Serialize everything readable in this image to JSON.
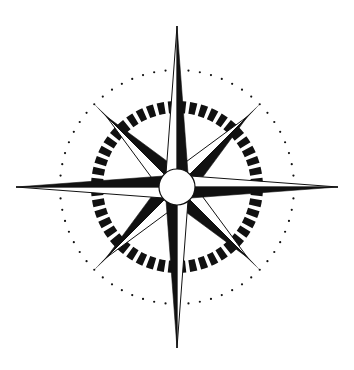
{
  "image": {
    "title": "Compass Rose",
    "subject": "compass-rose",
    "width": 354,
    "height": 370,
    "background_color": "#ffffff",
    "ink_color": "#111111",
    "style": "black and white line art, scanned drawing"
  },
  "geometry": {
    "center_x": 177,
    "center_y": 187,
    "hub_radius": 18,
    "hub_fill": "#ffffff",
    "hub_stroke": "#111111",
    "hub_stroke_width": 1.2,
    "ring_outer_radius": 86,
    "ring_inner_radius": 74,
    "ring_segment_count": 48,
    "ring_segment_gap_degrees": 2.6,
    "dotted_circle_radius": 117,
    "dot_count": 64,
    "dot_radius": 1.1
  },
  "points": {
    "cardinal": {
      "label": "cardinal-points",
      "count": 4,
      "directions": [
        "north",
        "east",
        "south",
        "west"
      ],
      "angles_degrees": [
        0,
        90,
        180,
        270
      ],
      "tip_distance": 161,
      "half_width": 12,
      "light_fill": "#ffffff",
      "dark_fill": "#111111",
      "stroke": "#111111"
    },
    "ordinal": {
      "label": "ordinal-points",
      "count": 4,
      "directions": [
        "northeast",
        "southeast",
        "southwest",
        "northwest"
      ],
      "angles_degrees": [
        45,
        135,
        225,
        315
      ],
      "tip_distance": 100,
      "half_width": 15,
      "light_fill": "#ffffff",
      "dark_fill": "#111111",
      "stroke": "#111111"
    },
    "needles": {
      "label": "ordinal-needles",
      "count": 4,
      "angles_degrees": [
        45,
        135,
        225,
        315
      ],
      "tip_distance": 118,
      "half_width": 2.6,
      "fill": "#111111"
    }
  },
  "cardinal_tips": {
    "north_y": 22,
    "south_y": 348,
    "west_x": 20,
    "east_x": 333
  }
}
